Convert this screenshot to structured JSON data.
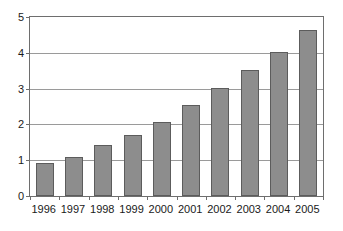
{
  "chart_data": {
    "type": "bar",
    "title": "",
    "subtitle": "",
    "xlabel": "",
    "ylabel": "",
    "categories": [
      "1996",
      "1997",
      "1998",
      "1999",
      "2000",
      "2001",
      "2002",
      "2003",
      "2004",
      "2005"
    ],
    "values": [
      0.92,
      1.1,
      1.42,
      1.71,
      2.07,
      2.53,
      3.03,
      3.53,
      4.02,
      4.63
    ],
    "ylim": [
      0,
      5
    ],
    "ytick_labels": [
      "0",
      "1",
      "2",
      "3",
      "4",
      "5"
    ],
    "ytick_values": [
      0,
      1,
      2,
      3,
      4,
      5
    ],
    "grid": "horizontal",
    "legend": "none",
    "annotations": [],
    "colors": {
      "bar_fill": "#8d8d8d",
      "bar_border": "#5c5c5c",
      "gridline": "#9a9a9a",
      "axis": "#6e6e6e",
      "text": "#1a1a1a",
      "background": "#ffffff"
    }
  }
}
